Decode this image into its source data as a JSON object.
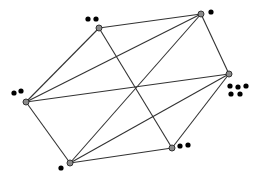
{
  "diagram": {
    "type": "graph",
    "width": 263,
    "height": 179,
    "colors": {
      "background": "#ffffff",
      "edge": "#333333",
      "vertex_fill": "#8a8a8a",
      "vertex_stroke": "#333333",
      "token": "#000000"
    },
    "vertices": [
      {
        "id": "A",
        "x": 99,
        "y": 28,
        "tokens": 2,
        "tokens_pos": [
          [
            88,
            19
          ],
          [
            96,
            19
          ]
        ]
      },
      {
        "id": "B",
        "x": 201,
        "y": 14,
        "tokens": 1,
        "tokens_pos": [
          [
            211,
            12
          ]
        ]
      },
      {
        "id": "C",
        "x": 229,
        "y": 74,
        "tokens": 5,
        "tokens_pos": [
          [
            230,
            86
          ],
          [
            238,
            87
          ],
          [
            246,
            86
          ],
          [
            231,
            94
          ],
          [
            240,
            94
          ]
        ]
      },
      {
        "id": "D",
        "x": 26,
        "y": 102,
        "tokens": 2,
        "tokens_pos": [
          [
            14,
            93
          ],
          [
            21,
            91
          ]
        ]
      },
      {
        "id": "E",
        "x": 172,
        "y": 148,
        "tokens": 2,
        "tokens_pos": [
          [
            180,
            146
          ],
          [
            188,
            145
          ]
        ]
      },
      {
        "id": "F",
        "x": 70,
        "y": 163,
        "tokens": 1,
        "tokens_pos": [
          [
            61,
            168
          ]
        ]
      }
    ],
    "edges": [
      [
        "A",
        "B"
      ],
      [
        "B",
        "C"
      ],
      [
        "C",
        "E"
      ],
      [
        "E",
        "F"
      ],
      [
        "F",
        "D"
      ],
      [
        "D",
        "A"
      ],
      [
        "A",
        "E"
      ],
      [
        "D",
        "B"
      ],
      [
        "D",
        "C"
      ],
      [
        "F",
        "B"
      ],
      [
        "F",
        "C"
      ]
    ]
  }
}
